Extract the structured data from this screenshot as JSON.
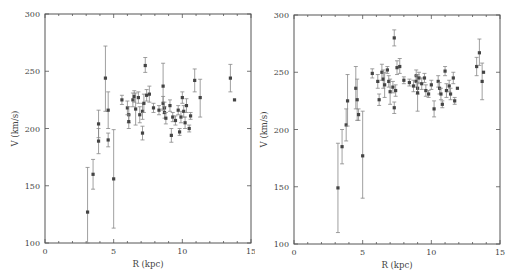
{
  "chart_data": [
    {
      "type": "scatter",
      "panel": "left",
      "title": "",
      "xlabel": "R (kpc)",
      "ylabel": "V (km/s)",
      "xlim": [
        0,
        15
      ],
      "ylim": [
        100,
        300
      ],
      "xticks": [
        0,
        5,
        10,
        15
      ],
      "yticks": [
        100,
        150,
        200,
        250,
        300
      ],
      "grid": false,
      "legend": null,
      "error_bars": true,
      "points": [
        {
          "x": 3.1,
          "y": 127,
          "lo": 100,
          "hi": 166
        },
        {
          "x": 3.5,
          "y": 160,
          "lo": 147,
          "hi": 173
        },
        {
          "x": 3.9,
          "y": 189,
          "lo": 178,
          "hi": 200
        },
        {
          "x": 3.9,
          "y": 204,
          "lo": 192,
          "hi": 216
        },
        {
          "x": 4.4,
          "y": 244,
          "lo": 215,
          "hi": 272
        },
        {
          "x": 4.6,
          "y": 216,
          "lo": 200,
          "hi": 232
        },
        {
          "x": 4.6,
          "y": 190,
          "lo": 184,
          "hi": 196
        },
        {
          "x": 5.0,
          "y": 156,
          "lo": 113,
          "hi": 199
        },
        {
          "x": 5.6,
          "y": 225,
          "lo": 221,
          "hi": 229
        },
        {
          "x": 6.0,
          "y": 218,
          "lo": 212,
          "hi": 224
        },
        {
          "x": 6.1,
          "y": 212,
          "lo": 205,
          "hi": 219
        },
        {
          "x": 6.1,
          "y": 206,
          "lo": 200,
          "hi": 212
        },
        {
          "x": 6.4,
          "y": 225,
          "lo": 219,
          "hi": 231
        },
        {
          "x": 6.5,
          "y": 228,
          "lo": 223,
          "hi": 233
        },
        {
          "x": 6.6,
          "y": 217,
          "lo": 203,
          "hi": 231
        },
        {
          "x": 6.8,
          "y": 227,
          "lo": 222,
          "hi": 232
        },
        {
          "x": 6.9,
          "y": 212,
          "lo": 205,
          "hi": 219
        },
        {
          "x": 7.1,
          "y": 215,
          "lo": 208,
          "hi": 222
        },
        {
          "x": 7.1,
          "y": 196,
          "lo": 190,
          "hi": 202
        },
        {
          "x": 7.2,
          "y": 222,
          "lo": 214,
          "hi": 230
        },
        {
          "x": 7.3,
          "y": 255,
          "lo": 249,
          "hi": 262
        },
        {
          "x": 7.4,
          "y": 229,
          "lo": 224,
          "hi": 234
        },
        {
          "x": 7.6,
          "y": 230,
          "lo": 223,
          "hi": 237
        },
        {
          "x": 7.9,
          "y": 218,
          "lo": 214,
          "hi": 222
        },
        {
          "x": 8.3,
          "y": 216,
          "lo": 212,
          "hi": 220
        },
        {
          "x": 8.6,
          "y": 237,
          "lo": 217,
          "hi": 257
        },
        {
          "x": 8.6,
          "y": 222,
          "lo": 216,
          "hi": 228
        },
        {
          "x": 8.7,
          "y": 218,
          "lo": 213,
          "hi": 223
        },
        {
          "x": 8.7,
          "y": 214,
          "lo": 209,
          "hi": 219
        },
        {
          "x": 8.8,
          "y": 209,
          "lo": 204,
          "hi": 214
        },
        {
          "x": 9.1,
          "y": 220,
          "lo": 215,
          "hi": 225
        },
        {
          "x": 9.3,
          "y": 210,
          "lo": 206,
          "hi": 214
        },
        {
          "x": 9.2,
          "y": 194,
          "lo": 188,
          "hi": 200
        },
        {
          "x": 9.5,
          "y": 207,
          "lo": 203,
          "hi": 211
        },
        {
          "x": 9.7,
          "y": 216,
          "lo": 212,
          "hi": 220
        },
        {
          "x": 9.8,
          "y": 197,
          "lo": 194,
          "hi": 200
        },
        {
          "x": 9.9,
          "y": 210,
          "lo": 205,
          "hi": 215
        },
        {
          "x": 10.0,
          "y": 227,
          "lo": 222,
          "hi": 232
        },
        {
          "x": 10.1,
          "y": 215,
          "lo": 210,
          "hi": 220
        },
        {
          "x": 10.2,
          "y": 205,
          "lo": 200,
          "hi": 210
        },
        {
          "x": 10.3,
          "y": 220,
          "lo": 214,
          "hi": 226
        },
        {
          "x": 10.5,
          "y": 200,
          "lo": 197,
          "hi": 203
        },
        {
          "x": 10.6,
          "y": 211,
          "lo": 208,
          "hi": 214
        },
        {
          "x": 10.9,
          "y": 242,
          "lo": 232,
          "hi": 252
        },
        {
          "x": 11.3,
          "y": 227,
          "lo": 210,
          "hi": 243
        },
        {
          "x": 13.5,
          "y": 244,
          "lo": 232,
          "hi": 256
        },
        {
          "x": 13.8,
          "y": 225,
          "lo": 225,
          "hi": 225
        }
      ]
    },
    {
      "type": "scatter",
      "panel": "right",
      "title": "",
      "xlabel": "R (kpc)",
      "ylabel": "V (km/s)",
      "xlim": [
        0,
        15
      ],
      "ylim": [
        100,
        300
      ],
      "xticks": [
        0,
        5,
        10,
        15
      ],
      "yticks": [
        100,
        150,
        200,
        250,
        300
      ],
      "grid": false,
      "legend": null,
      "error_bars": true,
      "points": [
        {
          "x": 3.2,
          "y": 149,
          "lo": 110,
          "hi": 188
        },
        {
          "x": 3.5,
          "y": 185,
          "lo": 170,
          "hi": 200
        },
        {
          "x": 3.8,
          "y": 204,
          "lo": 190,
          "hi": 218
        },
        {
          "x": 3.9,
          "y": 225,
          "lo": 203,
          "hi": 248
        },
        {
          "x": 4.5,
          "y": 236,
          "lo": 218,
          "hi": 255
        },
        {
          "x": 4.6,
          "y": 226,
          "lo": 208,
          "hi": 244
        },
        {
          "x": 4.7,
          "y": 213,
          "lo": 208,
          "hi": 218
        },
        {
          "x": 5.0,
          "y": 177,
          "lo": 140,
          "hi": 216
        },
        {
          "x": 5.7,
          "y": 249,
          "lo": 245,
          "hi": 253
        },
        {
          "x": 6.1,
          "y": 242,
          "lo": 236,
          "hi": 248
        },
        {
          "x": 6.2,
          "y": 226,
          "lo": 221,
          "hi": 231
        },
        {
          "x": 6.4,
          "y": 250,
          "lo": 243,
          "hi": 257
        },
        {
          "x": 6.5,
          "y": 244,
          "lo": 236,
          "hi": 252
        },
        {
          "x": 6.6,
          "y": 239,
          "lo": 228,
          "hi": 250
        },
        {
          "x": 6.8,
          "y": 252,
          "lo": 249,
          "hi": 255
        },
        {
          "x": 6.9,
          "y": 242,
          "lo": 237,
          "hi": 247
        },
        {
          "x": 7.0,
          "y": 233,
          "lo": 222,
          "hi": 244
        },
        {
          "x": 7.2,
          "y": 237,
          "lo": 232,
          "hi": 242
        },
        {
          "x": 7.3,
          "y": 219,
          "lo": 214,
          "hi": 224
        },
        {
          "x": 7.3,
          "y": 280,
          "lo": 273,
          "hi": 287
        },
        {
          "x": 7.4,
          "y": 234,
          "lo": 229,
          "hi": 239
        },
        {
          "x": 7.5,
          "y": 254,
          "lo": 248,
          "hi": 260
        },
        {
          "x": 7.7,
          "y": 255,
          "lo": 249,
          "hi": 262
        },
        {
          "x": 8.0,
          "y": 243,
          "lo": 240,
          "hi": 246
        },
        {
          "x": 8.4,
          "y": 241,
          "lo": 238,
          "hi": 244
        },
        {
          "x": 8.7,
          "y": 238,
          "lo": 233,
          "hi": 243
        },
        {
          "x": 8.9,
          "y": 247,
          "lo": 242,
          "hi": 252
        },
        {
          "x": 8.9,
          "y": 242,
          "lo": 237,
          "hi": 247
        },
        {
          "x": 9.0,
          "y": 236,
          "lo": 231,
          "hi": 241
        },
        {
          "x": 9.0,
          "y": 232,
          "lo": 216,
          "hi": 248
        },
        {
          "x": 9.1,
          "y": 245,
          "lo": 240,
          "hi": 250
        },
        {
          "x": 9.3,
          "y": 240,
          "lo": 235,
          "hi": 245
        },
        {
          "x": 9.5,
          "y": 245,
          "lo": 241,
          "hi": 249
        },
        {
          "x": 9.6,
          "y": 234,
          "lo": 229,
          "hi": 239
        },
        {
          "x": 9.8,
          "y": 231,
          "lo": 228,
          "hi": 234
        },
        {
          "x": 10.0,
          "y": 239,
          "lo": 235,
          "hi": 243
        },
        {
          "x": 10.2,
          "y": 218,
          "lo": 211,
          "hi": 225
        },
        {
          "x": 10.5,
          "y": 242,
          "lo": 237,
          "hi": 247
        },
        {
          "x": 10.6,
          "y": 236,
          "lo": 231,
          "hi": 241
        },
        {
          "x": 10.7,
          "y": 231,
          "lo": 226,
          "hi": 236
        },
        {
          "x": 10.8,
          "y": 222,
          "lo": 219,
          "hi": 225
        },
        {
          "x": 11.0,
          "y": 251,
          "lo": 247,
          "hi": 255
        },
        {
          "x": 11.1,
          "y": 234,
          "lo": 228,
          "hi": 240
        },
        {
          "x": 11.3,
          "y": 238,
          "lo": 233,
          "hi": 243
        },
        {
          "x": 11.4,
          "y": 231,
          "lo": 226,
          "hi": 236
        },
        {
          "x": 11.6,
          "y": 245,
          "lo": 240,
          "hi": 250
        },
        {
          "x": 11.7,
          "y": 225,
          "lo": 222,
          "hi": 228
        },
        {
          "x": 11.9,
          "y": 236,
          "lo": 236,
          "hi": 236
        },
        {
          "x": 13.3,
          "y": 255,
          "lo": 247,
          "hi": 263
        },
        {
          "x": 13.7,
          "y": 242,
          "lo": 226,
          "hi": 258
        },
        {
          "x": 13.5,
          "y": 267,
          "lo": 256,
          "hi": 279
        },
        {
          "x": 13.8,
          "y": 250,
          "lo": 250,
          "hi": 250
        }
      ]
    }
  ],
  "colors": {
    "axis": "#555555",
    "marker": "#444444",
    "error_bar": "#888888",
    "text": "#444444",
    "background": "#ffffff"
  }
}
